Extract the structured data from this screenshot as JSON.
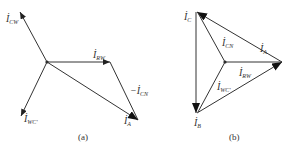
{
  "figure_a": {
    "caption": "(a)",
    "labels": {
      "i_cw": {
        "main": "İ",
        "sub": "CW"
      },
      "i_rw": {
        "main": "İ",
        "sub": "RW"
      },
      "neg_i_cn": {
        "main": "−İ",
        "sub": "CN"
      },
      "i_a": {
        "main": "İ",
        "sub": "A"
      },
      "i_wc": {
        "main": "İ",
        "sub": "WC'"
      }
    }
  },
  "figure_b": {
    "caption": "(b)",
    "labels": {
      "i_c": {
        "main": "İ",
        "sub": "C"
      },
      "i_cn": {
        "main": "İ",
        "sub": "CN"
      },
      "i_a": {
        "main": "İ",
        "sub": "A"
      },
      "i_rw": {
        "main": "İ",
        "sub": "RW"
      },
      "i_wc": {
        "main": "İ",
        "sub": "WC'"
      },
      "i_b": {
        "main": "İ",
        "sub": "B"
      }
    }
  },
  "colors": {
    "stroke": "#333333",
    "background": "#ffffff"
  }
}
